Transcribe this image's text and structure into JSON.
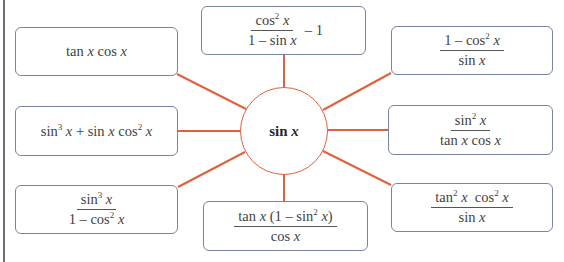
{
  "diagram": {
    "center": {
      "label_fn": "sin",
      "label_var": "x"
    },
    "colors": {
      "connector": "#e0603c",
      "box_border": "#7b83a3",
      "text": "#3f3f3f"
    },
    "boxes": [
      {
        "id": "top-left",
        "type": "plain",
        "parts": [
          "tan ",
          "x",
          " cos ",
          "x"
        ]
      },
      {
        "id": "top-center",
        "type": "fraction-minus",
        "num": {
          "fn": "cos",
          "exp": "2",
          "var": "x"
        },
        "den": {
          "pre": "1 – sin ",
          "var": "x"
        },
        "tail": "– 1"
      },
      {
        "id": "top-right",
        "type": "fraction",
        "num": {
          "pre": "1 –  cos",
          "exp": "2",
          "var": "x"
        },
        "den": {
          "pre": "sin ",
          "var": "x"
        }
      },
      {
        "id": "middle-left",
        "type": "sum",
        "t1_fn": "sin",
        "t1_exp": "3",
        "t1_var": "x",
        "op": " + ",
        "t2_fn": "sin ",
        "t2_var": "x",
        "t2_fn2": " cos",
        "t2_exp": "2",
        "t2_var2": "x"
      },
      {
        "id": "middle-right",
        "type": "fraction",
        "num": {
          "fn": "sin",
          "exp": "2",
          "var": "x"
        },
        "den": {
          "pre": "tan ",
          "var": "x",
          "mid": " cos ",
          "var2": "x"
        }
      },
      {
        "id": "bottom-left",
        "type": "fraction",
        "num": {
          "fn": "sin",
          "exp": "3",
          "var": "x"
        },
        "den": {
          "pre": "1 –  cos",
          "exp": "2",
          "var": "x"
        }
      },
      {
        "id": "bottom-center",
        "type": "fraction",
        "num": {
          "pre": "tan ",
          "var": "x",
          "mid": " (1 – sin",
          "exp": "2",
          "var2": "x",
          "post": ")"
        },
        "den": {
          "pre": "cos ",
          "var": "x"
        }
      },
      {
        "id": "bottom-right",
        "type": "fraction",
        "num": {
          "fn": "tan",
          "exp": "2",
          "var": "x",
          "fn2": "  cos",
          "exp2": "2",
          "var2": "x"
        },
        "den": {
          "pre": "sin ",
          "var": "x"
        }
      }
    ]
  }
}
